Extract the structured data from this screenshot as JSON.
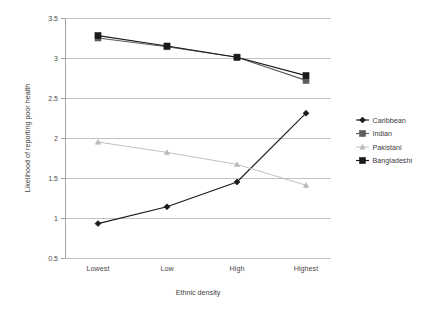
{
  "chart_data": {
    "type": "line",
    "title": "",
    "xlabel": "Ethnic density",
    "ylabel": "Likelihood of reporting poor health",
    "categories": [
      "Lowest",
      "Low",
      "High",
      "Highest"
    ],
    "ylim": [
      0.5,
      3.5
    ],
    "yticks": [
      "0.5",
      "1",
      "1.5",
      "2",
      "2.5",
      "3",
      "3.5"
    ],
    "ytick_values": [
      0.5,
      1,
      1.5,
      2,
      2.5,
      3,
      3.5
    ],
    "grid": "horizontal",
    "legend_position": "right",
    "series": [
      {
        "name": "Caribbean",
        "values": [
          0.93,
          1.14,
          1.45,
          2.31
        ],
        "color": "#1a1a1a",
        "marker": "diamond"
      },
      {
        "name": "Indian",
        "values": [
          3.25,
          3.14,
          3.01,
          2.72
        ],
        "color": "#5d5d5d",
        "marker": "square"
      },
      {
        "name": "Pakistani",
        "values": [
          1.95,
          1.82,
          1.67,
          1.41
        ],
        "color": "#b9b9b9",
        "marker": "triangle"
      },
      {
        "name": "Bangladeshi",
        "values": [
          3.28,
          3.15,
          3.01,
          2.78
        ],
        "color": "#1a1a1a",
        "marker": "square"
      }
    ]
  },
  "axes": {
    "y_title": "Likelihood of reporting poor health",
    "x_title": "Ethnic density"
  },
  "ticks": {
    "y": [
      "3.5",
      "3",
      "2.5",
      "2",
      "1.5",
      "1",
      "0.5"
    ],
    "x": [
      "Lowest",
      "Low",
      "High",
      "Highest"
    ]
  },
  "legend": {
    "items": [
      {
        "label": "Caribbean"
      },
      {
        "label": "Indian"
      },
      {
        "label": "Pakistani"
      },
      {
        "label": "Bangladeshi"
      }
    ]
  }
}
